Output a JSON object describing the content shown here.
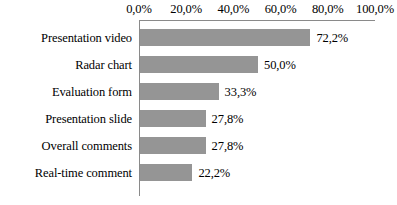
{
  "chart_data": {
    "type": "bar",
    "orientation": "horizontal",
    "title": "",
    "xlabel": "",
    "ylabel": "",
    "xlim": [
      0,
      100
    ],
    "xticks": [
      "0,0%",
      "20,0%",
      "40,0%",
      "60,0%",
      "80,0%",
      "100,0%"
    ],
    "xtick_values": [
      0,
      20,
      40,
      60,
      80,
      100
    ],
    "grid": false,
    "legend": null,
    "decimal_separator": ",",
    "categories": [
      "Presentation video",
      "Radar chart",
      "Evaluation form",
      "Presentation slide",
      "Overall comments",
      "Real-time comment"
    ],
    "values": [
      72.2,
      50.0,
      33.3,
      27.8,
      27.8,
      22.2
    ],
    "data_labels": [
      "72,2%",
      "50,0%",
      "33,3%",
      "27,8%",
      "27,8%",
      "22,2%"
    ],
    "bar_color": "#959595",
    "axis_color": "#8a8a8a",
    "text_color": "#000000"
  }
}
